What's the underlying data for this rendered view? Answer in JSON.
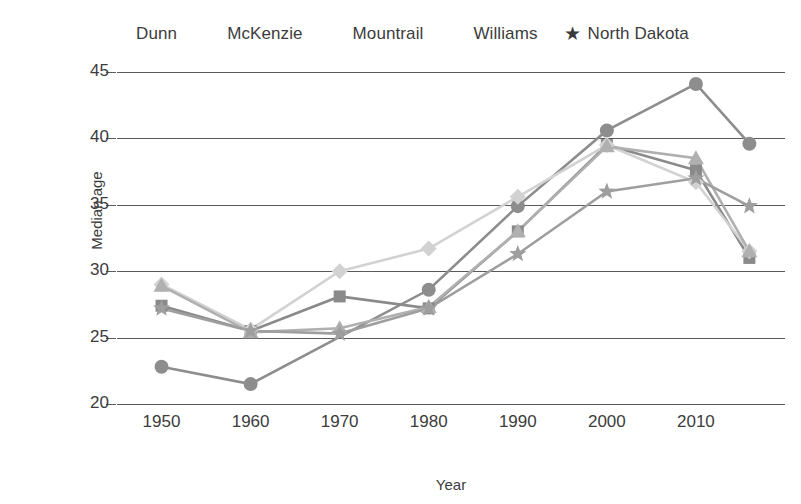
{
  "chart_data": {
    "type": "line",
    "title": "",
    "xlabel": "Year",
    "ylabel": "Median age",
    "x": [
      1950,
      1960,
      1970,
      1980,
      1990,
      2000,
      2010,
      2016
    ],
    "xtick_labels": [
      "1950",
      "1960",
      "1970",
      "1980",
      "1990",
      "2000",
      "2010"
    ],
    "xticks": [
      1950,
      1960,
      1970,
      1980,
      1990,
      2000,
      2010
    ],
    "yticks": [
      20,
      25,
      30,
      35,
      40,
      45
    ],
    "ytick_labels": [
      "20",
      "25",
      "30",
      "35",
      "40",
      "45"
    ],
    "ylim": [
      20,
      45
    ],
    "xlim": [
      1945,
      2020
    ],
    "grid": "horizontal",
    "legend_position": "top",
    "series": [
      {
        "name": "Dunn",
        "marker": "circle",
        "color": "#8d8d8d",
        "values": [
          22.8,
          21.5,
          null,
          28.6,
          34.9,
          40.6,
          44.1,
          39.6
        ]
      },
      {
        "name": "McKenzie",
        "marker": "square",
        "color": "#8a8a8a",
        "values": [
          27.4,
          25.5,
          28.1,
          27.2,
          33.0,
          39.5,
          37.6,
          31.0
        ]
      },
      {
        "name": "Mountrail",
        "marker": "diamond",
        "color": "#d2d2d2",
        "values": [
          29.0,
          25.6,
          30.0,
          31.7,
          35.6,
          39.5,
          36.7,
          31.5
        ]
      },
      {
        "name": "Williams",
        "marker": "triangle",
        "color": "#b0b0b0",
        "values": [
          28.9,
          25.4,
          25.7,
          27.3,
          33.0,
          39.4,
          38.5,
          31.5
        ]
      },
      {
        "name": "North Dakota",
        "marker": "star",
        "color": "#9e9e9e",
        "values": [
          27.2,
          25.5,
          25.3,
          27.2,
          31.3,
          36.0,
          37.0,
          34.9
        ]
      }
    ]
  },
  "legend": {
    "items": [
      {
        "label": "Dunn",
        "marker": "circle-marker-icon"
      },
      {
        "label": "McKenzie",
        "marker": "square-marker-icon"
      },
      {
        "label": "Mountrail",
        "marker": "diamond-marker-icon"
      },
      {
        "label": "Williams",
        "marker": "triangle-marker-icon"
      },
      {
        "label": "North Dakota",
        "marker": "star-marker-icon"
      }
    ]
  },
  "axes": {
    "y_title": "Median age",
    "x_title": "Year"
  }
}
